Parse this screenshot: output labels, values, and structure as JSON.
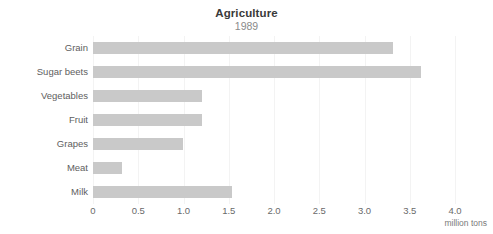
{
  "chart_data": {
    "type": "bar",
    "orientation": "horizontal",
    "title": "Agriculture",
    "subtitle": "1989",
    "xlabel": "million tons",
    "ylabel": "",
    "categories": [
      "Grain",
      "Sugar beets",
      "Vegetables",
      "Fruit",
      "Grapes",
      "Meat",
      "Milk"
    ],
    "values": [
      3.32,
      3.62,
      1.2,
      1.2,
      0.99,
      0.32,
      1.54
    ],
    "xlim": [
      0,
      4.0
    ],
    "xticks": [
      0,
      0.5,
      1.0,
      1.5,
      2.0,
      2.5,
      3.0,
      3.5,
      4.0
    ],
    "xtick_labels": [
      "0",
      "0.5",
      "1.0",
      "1.5",
      "2.0",
      "2.5",
      "3.0",
      "3.5",
      "4.0"
    ],
    "grid": true,
    "legend": false,
    "bar_color": "#c9c9c9",
    "grid_color": "#f3f3f3",
    "background_color": "#ffffff",
    "title_color": "#3a3a3a",
    "subtitle_color": "#8a8a8a",
    "label_color": "#5e5e5e"
  }
}
